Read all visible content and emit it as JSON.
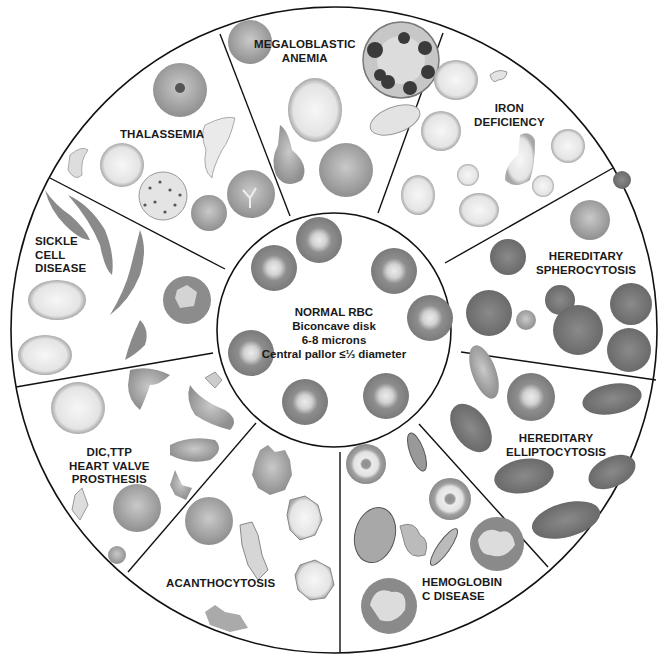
{
  "diagram": {
    "center": {
      "title": "NORMAL RBC",
      "line1": "Biconcave disk",
      "line2": "6-8 microns",
      "line3": "Central pallor ≤⅓ diameter"
    },
    "segments": [
      {
        "id": "megaloblastic-anemia",
        "label": "MEGALOBLASTIC\nANEMIA"
      },
      {
        "id": "iron-deficiency",
        "label": "IRON\nDEFICIENCY"
      },
      {
        "id": "hereditary-spherocytosis",
        "label": "HEREDITARY\nSPHEROCYTOSIS"
      },
      {
        "id": "hereditary-elliptocytosis",
        "label": "HEREDITARY\nELLIPTOCYTOSIS"
      },
      {
        "id": "hemoglobin-c-disease",
        "label": "HEMOGLOBIN\nC DISEASE"
      },
      {
        "id": "acanthocytosis",
        "label": "ACANTHOCYTOSIS"
      },
      {
        "id": "dic-ttp-heart-valve",
        "label": "DIC,TTP\nHEART VALVE\nPROSTHESIS"
      },
      {
        "id": "sickle-cell-disease",
        "label": "SICKLE\nCELL\nDISEASE"
      },
      {
        "id": "thalassemia",
        "label": "THALASSEMIA"
      }
    ],
    "colors": {
      "line": "#111111",
      "cell_dark": "#7a7a7a",
      "cell_mid": "#a5a5a5",
      "cell_light": "#d8d8d8",
      "pallor": "#e6e6e6",
      "background": "#ffffff"
    }
  }
}
